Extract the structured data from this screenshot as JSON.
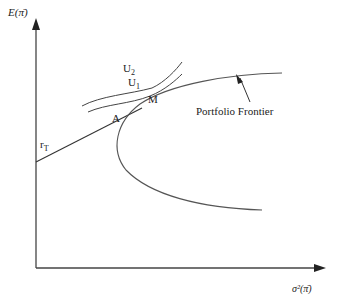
{
  "diagram": {
    "title": "",
    "axes": {
      "y_label": "E(π̄)",
      "x_label": "σ²(π̄)"
    },
    "labels": {
      "risk_free": "r",
      "risk_free_sub": "T",
      "point_A": "A",
      "point_M": "M",
      "u2": "U",
      "u2_sub": "2",
      "u1": "U",
      "u1_sub": "1",
      "frontier": "Portfolio Frontier"
    },
    "colors": {
      "line": "#333333",
      "curve": "#555555",
      "text": "#222222"
    }
  }
}
